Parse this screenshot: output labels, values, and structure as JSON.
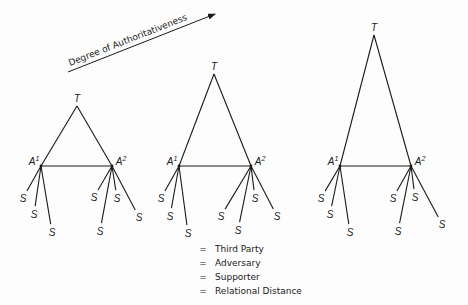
{
  "axis": {
    "label": "Degree of Authoritativeness",
    "arrow": {
      "x1": 68,
      "y1": 72,
      "x2": 215,
      "y2": 14
    }
  },
  "diagrams": [
    {
      "id": "low",
      "T": {
        "label": "T",
        "x": 77,
        "y": 106
      },
      "A1": {
        "label": "A",
        "sup": "1",
        "x": 41,
        "y": 166
      },
      "A2": {
        "label": "A",
        "sup": "2",
        "x": 112,
        "y": 166
      },
      "A1_supporters": [
        {
          "x": 23,
          "y": 198
        },
        {
          "x": 34,
          "y": 214
        },
        {
          "x": 52,
          "y": 232
        }
      ],
      "A2_supporters": [
        {
          "x": 94,
          "y": 197
        },
        {
          "x": 117,
          "y": 198
        },
        {
          "x": 100,
          "y": 231
        },
        {
          "x": 139,
          "y": 217
        }
      ]
    },
    {
      "id": "medium",
      "T": {
        "label": "T",
        "x": 214,
        "y": 74
      },
      "A1": {
        "label": "A",
        "sup": "1",
        "x": 179,
        "y": 166
      },
      "A2": {
        "label": "A",
        "sup": "2",
        "x": 251,
        "y": 166
      },
      "A1_supporters": [
        {
          "x": 161,
          "y": 198
        },
        {
          "x": 170,
          "y": 216
        },
        {
          "x": 188,
          "y": 233
        }
      ],
      "A2_supporters": [
        {
          "x": 221,
          "y": 216
        },
        {
          "x": 255,
          "y": 198
        },
        {
          "x": 238,
          "y": 230
        },
        {
          "x": 277,
          "y": 216
        }
      ]
    },
    {
      "id": "high",
      "T": {
        "label": "T",
        "x": 374,
        "y": 35
      },
      "A1": {
        "label": "A",
        "sup": "1",
        "x": 340,
        "y": 166
      },
      "A2": {
        "label": "A",
        "sup": "2",
        "x": 411,
        "y": 166
      },
      "A1_supporters": [
        {
          "x": 321,
          "y": 198
        },
        {
          "x": 330,
          "y": 214
        },
        {
          "x": 350,
          "y": 232
        }
      ],
      "A2_supporters": [
        {
          "x": 393,
          "y": 198
        },
        {
          "x": 415,
          "y": 197
        },
        {
          "x": 398,
          "y": 231
        },
        {
          "x": 442,
          "y": 224
        }
      ]
    }
  ],
  "supporter_label": "S",
  "legend": [
    {
      "key": "T",
      "eq": "=",
      "value": "Third Party",
      "italic": true
    },
    {
      "key": "A",
      "eq": "=",
      "value": "Adversary",
      "italic": true
    },
    {
      "key": "S",
      "eq": "=",
      "value": "Supporter",
      "italic": true
    },
    {
      "key": "Length of Line",
      "eq": "=",
      "value": "Relational Distance",
      "italic": false
    }
  ],
  "colors": {
    "line": "#1a1a1a",
    "background": "#fdfdfd"
  }
}
